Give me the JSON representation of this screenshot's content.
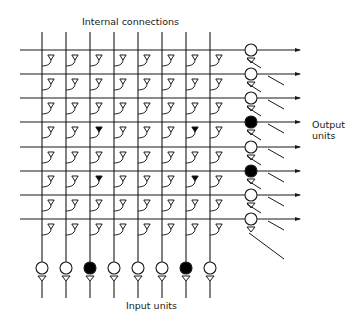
{
  "labels": {
    "internal_connections": "Internal connections",
    "output_units_line1": "Output",
    "output_units_line2": "units",
    "input_units": "Input units"
  },
  "colors": {
    "line": "#1a1a1a",
    "fill_active": "#000000",
    "fill_inactive": "#ffffff",
    "background": "#ffffff"
  },
  "grid": {
    "columns_x": [
      42,
      66,
      90,
      114,
      138,
      162,
      186,
      210
    ],
    "rows_y": [
      50,
      74,
      98,
      122,
      147,
      171,
      195,
      219
    ],
    "vertical_top": 32,
    "horizontal_left": 20,
    "arrow_end_x": 300
  },
  "input_units": {
    "circle_y": 268,
    "radius": 6,
    "active": [
      false,
      false,
      true,
      false,
      false,
      false,
      true,
      false
    ]
  },
  "output_units": {
    "x": 251,
    "radius": 6,
    "active": [
      false,
      false,
      false,
      true,
      false,
      true,
      false,
      false
    ]
  },
  "synapses": {
    "filled": [
      [
        3,
        2
      ],
      [
        3,
        6
      ],
      [
        5,
        2
      ],
      [
        5,
        6
      ]
    ]
  }
}
